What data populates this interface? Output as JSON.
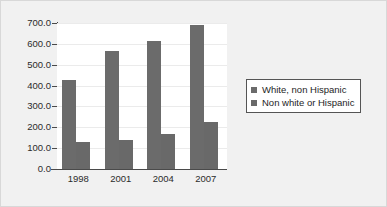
{
  "chart_data": {
    "type": "bar",
    "title": "",
    "subtitle": "",
    "xlabel": "",
    "ylabel": "",
    "categories": [
      "1998",
      "2001",
      "2004",
      "2007"
    ],
    "series": [
      {
        "name": "White, non Hispanic",
        "values": [
          425,
          568,
          613,
          690
        ],
        "color": "#6b6b6b"
      },
      {
        "name": "Non white or Hispanic",
        "values": [
          128,
          140,
          168,
          225
        ],
        "color": "#696969"
      }
    ],
    "ylim": [
      0,
      700
    ],
    "ytick_labels": [
      "700.0",
      "600.0",
      "500.0",
      "400.0",
      "300.0",
      "200.0",
      "100.0",
      "0.0"
    ],
    "ytick_values": [
      700,
      600,
      500,
      400,
      300,
      200,
      100,
      0
    ],
    "grid": true,
    "legend_position": "right"
  },
  "legend": {
    "items": [
      {
        "label": "White, non Hispanic"
      },
      {
        "label": "Non white or Hispanic"
      }
    ]
  },
  "colors": {
    "bar_primary": "#6b6b6b",
    "bar_secondary": "#696969",
    "plot_background": "#ffffff",
    "figure_background": "#f1f1f1",
    "axis": "#4a4a4a",
    "gridline": "#ebebeb"
  }
}
